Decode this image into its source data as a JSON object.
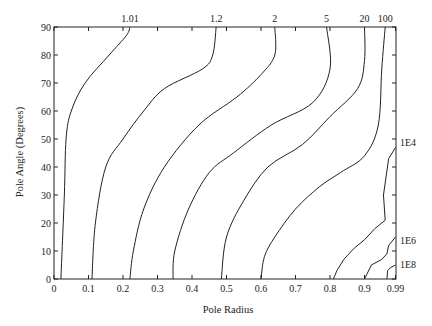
{
  "chart_data": {
    "type": "line",
    "subtype": "contour",
    "title": "",
    "xlabel": "Pole Radius",
    "ylabel": "Pole Angle (Degrees)",
    "xlim": [
      0,
      0.99
    ],
    "ylim": [
      0,
      90
    ],
    "x_ticks": [
      "0",
      "0.1",
      "0.2",
      "0.3",
      "0.4",
      "0.5",
      "0.6",
      "0.7",
      "0.8",
      "0.9",
      "0.99"
    ],
    "y_ticks": [
      "0",
      "10",
      "20",
      "30",
      "40",
      "50",
      "60",
      "70",
      "80",
      "90"
    ],
    "grid": false,
    "legend": "none",
    "contour_labels_top": [
      "1.01",
      "1.2",
      "2",
      "5",
      "20",
      "100"
    ],
    "contour_labels_right": [
      "1E4",
      "1E6",
      "1E8"
    ],
    "series": [
      {
        "name": "1.01",
        "points": [
          [
            0.02,
            0
          ],
          [
            0.03,
            30
          ],
          [
            0.035,
            50
          ],
          [
            0.05,
            60
          ],
          [
            0.09,
            70
          ],
          [
            0.16,
            80
          ],
          [
            0.21,
            87
          ],
          [
            0.22,
            90
          ]
        ]
      },
      {
        "name": "1.2",
        "points": [
          [
            0.11,
            0
          ],
          [
            0.12,
            20
          ],
          [
            0.15,
            40
          ],
          [
            0.2,
            50
          ],
          [
            0.26,
            60
          ],
          [
            0.32,
            68
          ],
          [
            0.43,
            75
          ],
          [
            0.46,
            80
          ],
          [
            0.47,
            90
          ]
        ]
      },
      {
        "name": "2",
        "points": [
          [
            0.22,
            0
          ],
          [
            0.23,
            10
          ],
          [
            0.26,
            25
          ],
          [
            0.32,
            40
          ],
          [
            0.42,
            55
          ],
          [
            0.53,
            65
          ],
          [
            0.6,
            73
          ],
          [
            0.64,
            80
          ],
          [
            0.64,
            90
          ]
        ]
      },
      {
        "name": "5",
        "points": [
          [
            0.345,
            0
          ],
          [
            0.35,
            10
          ],
          [
            0.39,
            25
          ],
          [
            0.45,
            38
          ],
          [
            0.52,
            45
          ],
          [
            0.63,
            55
          ],
          [
            0.75,
            63
          ],
          [
            0.8,
            75
          ],
          [
            0.79,
            90
          ]
        ]
      },
      {
        "name": "20",
        "points": [
          [
            0.485,
            0
          ],
          [
            0.5,
            15
          ],
          [
            0.55,
            28
          ],
          [
            0.62,
            40
          ],
          [
            0.72,
            48
          ],
          [
            0.8,
            58
          ],
          [
            0.88,
            68
          ],
          [
            0.9,
            78
          ],
          [
            0.9,
            90
          ]
        ]
      },
      {
        "name": "100",
        "points": [
          [
            0.6,
            0
          ],
          [
            0.61,
            8
          ],
          [
            0.64,
            15
          ],
          [
            0.7,
            25
          ],
          [
            0.77,
            33
          ],
          [
            0.83,
            38
          ],
          [
            0.9,
            44
          ],
          [
            0.94,
            55
          ],
          [
            0.95,
            75
          ],
          [
            0.96,
            90
          ]
        ]
      },
      {
        "name": "1E4",
        "points": [
          [
            0.81,
            0
          ],
          [
            0.82,
            3
          ],
          [
            0.84,
            7
          ],
          [
            0.87,
            11
          ],
          [
            0.9,
            14
          ],
          [
            0.93,
            18
          ],
          [
            0.96,
            21
          ],
          [
            0.955,
            30
          ],
          [
            0.97,
            43
          ],
          [
            0.99,
            47
          ]
        ]
      },
      {
        "name": "1E6",
        "points": [
          [
            0.9,
            0
          ],
          [
            0.92,
            5
          ],
          [
            0.95,
            7
          ],
          [
            0.965,
            9
          ],
          [
            0.97,
            12
          ],
          [
            0.99,
            15
          ]
        ]
      },
      {
        "name": "1E8",
        "points": [
          [
            0.965,
            0
          ],
          [
            0.967,
            3
          ],
          [
            0.975,
            4
          ],
          [
            0.99,
            5
          ]
        ]
      }
    ]
  },
  "labels": {
    "xlabel": "Pole Radius",
    "ylabel": "Pole Angle (Degrees)"
  }
}
